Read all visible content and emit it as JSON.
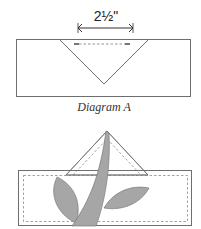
{
  "diagram_a": {
    "measurement": "2½\"",
    "caption": "Diagram A"
  },
  "colors": {
    "outline": "#6e6e6e",
    "dashed": "#8a8a8a",
    "fill_gray": "#a6a6a6",
    "text": "#333333"
  }
}
